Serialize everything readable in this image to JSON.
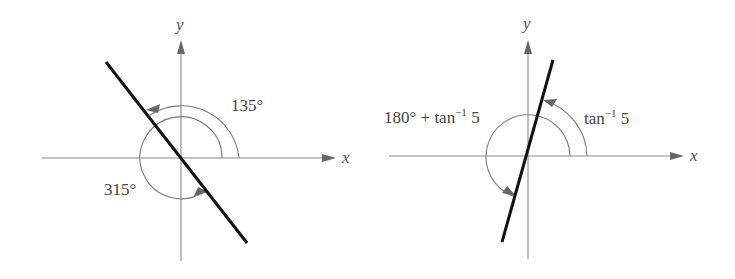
{
  "diagrams": [
    {
      "axis_labels": {
        "x": "x",
        "y": "y"
      },
      "angle_labels": {
        "outer": "135°",
        "inner": "315°"
      },
      "line_slope_description": "line through origin at 135°/315°"
    },
    {
      "axis_labels": {
        "x": "x",
        "y": "y"
      },
      "angle_labels": {
        "outer_base": "tan",
        "outer_sup": "−1",
        "outer_arg": " 5",
        "inner_prefix": "180° + tan",
        "inner_sup": "−1",
        "inner_arg": " 5"
      },
      "line_slope_description": "line through origin with slope 5"
    }
  ],
  "colors": {
    "axis": "#8a8a8a",
    "line": "#111111",
    "text": "#444444"
  }
}
